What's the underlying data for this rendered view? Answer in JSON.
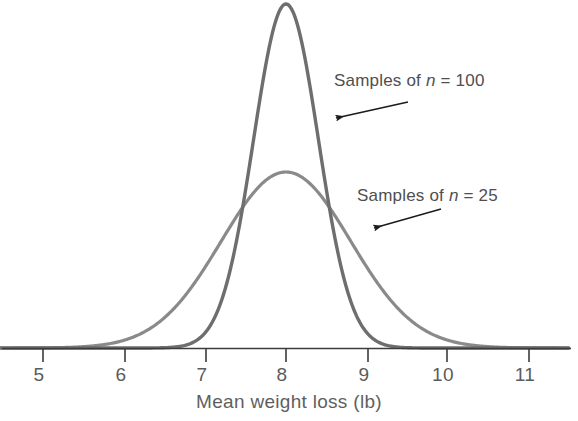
{
  "chart_data": {
    "type": "line",
    "title": "",
    "subtitle": "",
    "xlabel": "Mean weight loss (lb)",
    "ylabel": "",
    "xlim": [
      4.47,
      11.49
    ],
    "xticks": [
      5,
      6,
      7,
      8,
      9,
      10,
      11
    ],
    "xtick_labels": [
      "5",
      "6",
      "7",
      "8",
      "9",
      "10",
      "11"
    ],
    "grid": false,
    "legend": "annotations",
    "series": [
      {
        "name": "Samples of n = 100",
        "distribution": "normal",
        "mean": 8.0,
        "sigma": 0.4,
        "peak_height": 1.0,
        "color": "#6e6e6e",
        "annotation": "Samples of n = 100"
      },
      {
        "name": "Samples of n = 25",
        "distribution": "normal",
        "mean": 8.0,
        "sigma": 0.8,
        "peak_height": 0.5,
        "color": "#8a8a8a",
        "annotation": "Samples of n = 25"
      }
    ],
    "annotations": [
      {
        "text_prefix": "Samples of ",
        "text_italic": "n",
        "text_suffix": " = 100",
        "full_text": "Samples of n = 100",
        "arrow_from": [
          408,
          102
        ],
        "arrow_to": [
          333,
          119
        ]
      },
      {
        "text_prefix": "Samples of ",
        "text_italic": "n",
        "text_suffix": " = 25",
        "full_text": "Samples of n = 25",
        "arrow_from": [
          441,
          209
        ],
        "arrow_to": [
          371,
          229
        ]
      }
    ],
    "colors": {
      "curve_n100": "#6e6e6e",
      "curve_n25": "#8a8a8a",
      "axis": "#3c3c3c",
      "text": "#555555",
      "arrow": "#1c1c1c",
      "background": "#ffffff"
    }
  },
  "axis": {
    "title": "Mean weight loss (lb)",
    "ticks": [
      {
        "label": "5",
        "x": 43
      },
      {
        "label": "6",
        "x": 125
      },
      {
        "label": "7",
        "x": 206
      },
      {
        "label": "8",
        "x": 286
      },
      {
        "label": "9",
        "x": 368
      },
      {
        "label": "10",
        "x": 447
      },
      {
        "label": "11",
        "x": 529
      }
    ]
  },
  "annotations": {
    "n100": {
      "prefix": "Samples of ",
      "italic": "n",
      "suffix": " = 100"
    },
    "n25": {
      "prefix": "Samples of ",
      "italic": "n",
      "suffix": " = 25"
    }
  }
}
